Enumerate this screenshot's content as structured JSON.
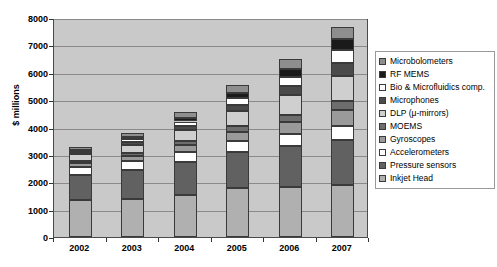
{
  "chart_data": {
    "type": "bar",
    "subtype": "stacked-column",
    "title": "",
    "xlabel": "",
    "ylabel": "$ millions",
    "ylim": [
      0,
      8000
    ],
    "ytick_step": 1000,
    "yticks": [
      0,
      1000,
      2000,
      3000,
      4000,
      5000,
      6000,
      7000,
      8000
    ],
    "ytick_labels": [
      "0",
      "1000",
      "2000",
      "3000",
      "4000",
      "5000",
      "6000",
      "7000",
      "8000"
    ],
    "grid": true,
    "grid_axis": "y",
    "legend_position": "right",
    "categories": [
      "2002",
      "2003",
      "2004",
      "2005",
      "2006",
      "2007"
    ],
    "stack_order_bottom_to_top": [
      "Inkjet Head",
      "Pressure sensors",
      "Accelerometers",
      "Gyroscopes",
      "MOEMS",
      "DLP (μ-mirrors)",
      "Microphones",
      "Bio & Microfluidics comp.",
      "RF MEMS",
      "Microbolometers"
    ],
    "series": [
      {
        "name": "Inkjet Head",
        "color": "#b0b0b0",
        "values": [
          1360,
          1390,
          1530,
          1780,
          1810,
          1900
        ]
      },
      {
        "name": "Pressure sensors",
        "color": "#616161",
        "values": [
          900,
          1050,
          1200,
          1320,
          1500,
          1650
        ]
      },
      {
        "name": "Accelerometers",
        "color": "#ffffff",
        "values": [
          280,
          330,
          380,
          420,
          470,
          520
        ]
      },
      {
        "name": "Gyroscopes",
        "color": "#9a9a9a",
        "values": [
          150,
          190,
          240,
          330,
          430,
          560
        ]
      },
      {
        "name": "MOEMS",
        "color": "#6e6e6e",
        "values": [
          90,
          110,
          140,
          190,
          260,
          340
        ]
      },
      {
        "name": "DLP (μ-mirrors)",
        "color": "#cfcfcf",
        "values": [
          240,
          300,
          420,
          560,
          700,
          900
        ]
      },
      {
        "name": "Microphones",
        "color": "#4a4a4a",
        "values": [
          60,
          90,
          140,
          220,
          330,
          470
        ]
      },
      {
        "name": "Bio & Microfluidics comp.",
        "color": "#ffffff",
        "values": [
          70,
          110,
          170,
          250,
          350,
          480
        ]
      },
      {
        "name": "RF MEMS",
        "color": "#1a1a1a",
        "values": [
          40,
          70,
          110,
          180,
          270,
          400
        ]
      },
      {
        "name": "Microbolometers",
        "color": "#8e8e8e",
        "values": [
          110,
          160,
          220,
          300,
          380,
          460
        ]
      }
    ],
    "totals": [
      3300,
      3800,
      4550,
      5550,
      6500,
      7680
    ]
  },
  "legend": {
    "items": [
      {
        "label": "Microbolometers",
        "swatch": "#8e8e8e"
      },
      {
        "label": "RF MEMS",
        "swatch": "#1a1a1a"
      },
      {
        "label": "Bio & Microfluidics comp.",
        "swatch": "#ffffff"
      },
      {
        "label": "Microphones",
        "swatch": "#4a4a4a"
      },
      {
        "label": "DLP (μ-mirrors)",
        "swatch": "#cfcfcf"
      },
      {
        "label": "MOEMS",
        "swatch": "#6e6e6e"
      },
      {
        "label": "Gyroscopes",
        "swatch": "#9a9a9a"
      },
      {
        "label": "Accelerometers",
        "swatch": "#ffffff"
      },
      {
        "label": "Pressure sensors",
        "swatch": "#616161"
      },
      {
        "label": "Inkjet Head",
        "swatch": "#b0b0b0"
      }
    ]
  }
}
